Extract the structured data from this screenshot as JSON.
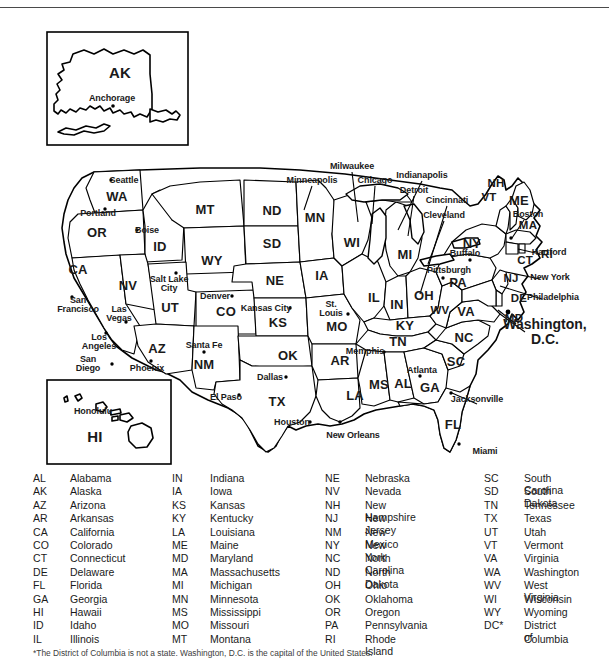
{
  "document": {
    "title": "Map of the United States with State Abbreviations",
    "footnote": "*The District of Columbia is not a state. Washington, D.C. is the capital of the United States."
  },
  "insets": [
    {
      "name": "alaska",
      "abbr": "AK",
      "cities": [
        "Anchorage"
      ]
    },
    {
      "name": "hawaii",
      "abbr": "HI",
      "cities": [
        "Honolulu"
      ]
    }
  ],
  "map": {
    "capital_label": "Washington,\nD.C.",
    "capital_line1": "Washington,",
    "capital_line2": "D.C.",
    "state_labels": [
      {
        "abbr": "WA",
        "x": 117,
        "y": 182
      },
      {
        "abbr": "OR",
        "x": 97,
        "y": 218
      },
      {
        "abbr": "CA",
        "x": 78,
        "y": 255
      },
      {
        "abbr": "NV",
        "x": 128,
        "y": 271
      },
      {
        "abbr": "ID",
        "x": 160,
        "y": 232
      },
      {
        "abbr": "MT",
        "x": 205,
        "y": 195
      },
      {
        "abbr": "WY",
        "x": 212,
        "y": 246
      },
      {
        "abbr": "UT",
        "x": 170,
        "y": 293
      },
      {
        "abbr": "AZ",
        "x": 157,
        "y": 334
      },
      {
        "abbr": "NM",
        "x": 204,
        "y": 350
      },
      {
        "abbr": "CO",
        "x": 226,
        "y": 297
      },
      {
        "abbr": "ND",
        "x": 272,
        "y": 196
      },
      {
        "abbr": "SD",
        "x": 272,
        "y": 229
      },
      {
        "abbr": "NE",
        "x": 275,
        "y": 266
      },
      {
        "abbr": "KS",
        "x": 278,
        "y": 308
      },
      {
        "abbr": "OK",
        "x": 288,
        "y": 341
      },
      {
        "abbr": "TX",
        "x": 277,
        "y": 387
      },
      {
        "abbr": "MN",
        "x": 315,
        "y": 203
      },
      {
        "abbr": "IA",
        "x": 322,
        "y": 261
      },
      {
        "abbr": "MO",
        "x": 337,
        "y": 312
      },
      {
        "abbr": "AR",
        "x": 340,
        "y": 346
      },
      {
        "abbr": "LA",
        "x": 355,
        "y": 381
      },
      {
        "abbr": "WI",
        "x": 352,
        "y": 228
      },
      {
        "abbr": "IL",
        "x": 374,
        "y": 283
      },
      {
        "abbr": "MS",
        "x": 379,
        "y": 370
      },
      {
        "abbr": "AL",
        "x": 403,
        "y": 369
      },
      {
        "abbr": "MI",
        "x": 405,
        "y": 240
      },
      {
        "abbr": "IN",
        "x": 397,
        "y": 290
      },
      {
        "abbr": "KY",
        "x": 405,
        "y": 311
      },
      {
        "abbr": "TN",
        "x": 398,
        "y": 327
      },
      {
        "abbr": "OH",
        "x": 424,
        "y": 281
      },
      {
        "abbr": "GA",
        "x": 430,
        "y": 373
      },
      {
        "abbr": "FL",
        "x": 453,
        "y": 410
      },
      {
        "abbr": "SC",
        "x": 456,
        "y": 347
      },
      {
        "abbr": "NC",
        "x": 464,
        "y": 323
      },
      {
        "abbr": "WV",
        "x": 440,
        "y": 297
      },
      {
        "abbr": "VA",
        "x": 466,
        "y": 297
      },
      {
        "abbr": "PA",
        "x": 458,
        "y": 268
      },
      {
        "abbr": "NY",
        "x": 472,
        "y": 229
      },
      {
        "abbr": "VT",
        "x": 489,
        "y": 184
      },
      {
        "abbr": "NH",
        "x": 496,
        "y": 170
      },
      {
        "abbr": "ME",
        "x": 519,
        "y": 186
      },
      {
        "abbr": "MA",
        "x": 528,
        "y": 212
      },
      {
        "abbr": "CT",
        "x": 525,
        "y": 247
      },
      {
        "abbr": "RI",
        "x": 547,
        "y": 241
      },
      {
        "abbr": "NJ",
        "x": 511,
        "y": 265
      },
      {
        "abbr": "DE",
        "x": 519,
        "y": 285
      },
      {
        "abbr": "MD",
        "x": 514,
        "y": 305
      }
    ],
    "city_labels": [
      {
        "name": "Seattle",
        "x": 124,
        "y": 166
      },
      {
        "name": "Portland",
        "x": 98,
        "y": 199
      },
      {
        "name": "Boise",
        "x": 147,
        "y": 216
      },
      {
        "name": "San\nFrancisco",
        "x": 78,
        "y": 291
      },
      {
        "name": "Las\nVegas",
        "x": 119,
        "y": 300
      },
      {
        "name": "Los\nAngeles",
        "x": 99,
        "y": 328
      },
      {
        "name": "San\nDiego",
        "x": 88,
        "y": 350
      },
      {
        "name": "Phoenix",
        "x": 147,
        "y": 354
      },
      {
        "name": "Salt Lake\nCity",
        "x": 169,
        "y": 270
      },
      {
        "name": "Denver",
        "x": 215,
        "y": 282
      },
      {
        "name": "Santa Fe",
        "x": 204,
        "y": 331
      },
      {
        "name": "El Paso",
        "x": 226,
        "y": 383
      },
      {
        "name": "Dallas",
        "x": 270,
        "y": 363
      },
      {
        "name": "Houston",
        "x": 292,
        "y": 408
      },
      {
        "name": "New Orleans",
        "x": 353,
        "y": 421
      },
      {
        "name": "Kansas City",
        "x": 266,
        "y": 294
      },
      {
        "name": "St.\nLouis",
        "x": 331,
        "y": 295
      },
      {
        "name": "Memphis",
        "x": 365,
        "y": 337
      },
      {
        "name": "Minneapolis",
        "x": 312,
        "y": 166
      },
      {
        "name": "Milwaukee",
        "x": 352,
        "y": 152
      },
      {
        "name": "Chicago",
        "x": 375,
        "y": 166
      },
      {
        "name": "Indianapolis",
        "x": 422,
        "y": 161
      },
      {
        "name": "Detroit",
        "x": 414,
        "y": 176
      },
      {
        "name": "Cincinnati",
        "x": 447,
        "y": 186
      },
      {
        "name": "Cleveland",
        "x": 444,
        "y": 201
      },
      {
        "name": "Buffalo",
        "x": 465,
        "y": 239
      },
      {
        "name": "Pittsburgh",
        "x": 449,
        "y": 256
      },
      {
        "name": "Boston",
        "x": 528,
        "y": 200
      },
      {
        "name": "Hartford",
        "x": 549,
        "y": 238
      },
      {
        "name": "New York",
        "x": 550,
        "y": 263
      },
      {
        "name": "Philadelphia",
        "x": 553,
        "y": 283
      },
      {
        "name": "Atlanta",
        "x": 422,
        "y": 356
      },
      {
        "name": "Jacksonville",
        "x": 477,
        "y": 385
      },
      {
        "name": "Miami",
        "x": 485,
        "y": 437
      }
    ]
  },
  "legend": {
    "columns": [
      {
        "abbr_x": 33,
        "name_x": 70,
        "rows": [
          {
            "abbr": "AL",
            "name": "Alabama"
          },
          {
            "abbr": "AK",
            "name": "Alaska"
          },
          {
            "abbr": "AZ",
            "name": "Arizona"
          },
          {
            "abbr": "AR",
            "name": "Arkansas"
          },
          {
            "abbr": "CA",
            "name": "California"
          },
          {
            "abbr": "CO",
            "name": "Colorado"
          },
          {
            "abbr": "CT",
            "name": "Connecticut"
          },
          {
            "abbr": "DE",
            "name": "Delaware"
          },
          {
            "abbr": "FL",
            "name": "Florida"
          },
          {
            "abbr": "GA",
            "name": "Georgia"
          },
          {
            "abbr": "HI",
            "name": "Hawaii"
          },
          {
            "abbr": "ID",
            "name": "Idaho"
          },
          {
            "abbr": "IL",
            "name": "Illinois"
          }
        ]
      },
      {
        "abbr_x": 172,
        "name_x": 210,
        "rows": [
          {
            "abbr": "IN",
            "name": "Indiana"
          },
          {
            "abbr": "IA",
            "name": "Iowa"
          },
          {
            "abbr": "KS",
            "name": "Kansas"
          },
          {
            "abbr": "KY",
            "name": "Kentucky"
          },
          {
            "abbr": "LA",
            "name": "Louisiana"
          },
          {
            "abbr": "ME",
            "name": "Maine"
          },
          {
            "abbr": "MD",
            "name": "Maryland"
          },
          {
            "abbr": "MA",
            "name": "Massachusetts"
          },
          {
            "abbr": "MI",
            "name": "Michigan"
          },
          {
            "abbr": "MN",
            "name": "Minnesota"
          },
          {
            "abbr": "MS",
            "name": "Mississippi"
          },
          {
            "abbr": "MO",
            "name": "Missouri"
          },
          {
            "abbr": "MT",
            "name": "Montana"
          }
        ]
      },
      {
        "abbr_x": 325,
        "name_x": 365,
        "rows": [
          {
            "abbr": "NE",
            "name": "Nebraska"
          },
          {
            "abbr": "NV",
            "name": "Nevada"
          },
          {
            "abbr": "NH",
            "name": "New Hampshire"
          },
          {
            "abbr": "NJ",
            "name": "New Jersey"
          },
          {
            "abbr": "NM",
            "name": "New Mexico"
          },
          {
            "abbr": "NY",
            "name": "New York"
          },
          {
            "abbr": "NC",
            "name": "North Carolina"
          },
          {
            "abbr": "ND",
            "name": "North Dakota"
          },
          {
            "abbr": "OH",
            "name": "Ohio"
          },
          {
            "abbr": "OK",
            "name": "Oklahoma"
          },
          {
            "abbr": "OR",
            "name": "Oregon"
          },
          {
            "abbr": "PA",
            "name": "Pennsylvania"
          },
          {
            "abbr": "RI",
            "name": "Rhode Island"
          }
        ]
      },
      {
        "abbr_x": 484,
        "name_x": 524,
        "rows": [
          {
            "abbr": "SC",
            "name": "South Carolina"
          },
          {
            "abbr": "SD",
            "name": "South Dakota"
          },
          {
            "abbr": "TN",
            "name": "Tennessee"
          },
          {
            "abbr": "TX",
            "name": "Texas"
          },
          {
            "abbr": "UT",
            "name": "Utah"
          },
          {
            "abbr": "VT",
            "name": "Vermont"
          },
          {
            "abbr": "VA",
            "name": "Virginia"
          },
          {
            "abbr": "WA",
            "name": "Washington"
          },
          {
            "abbr": "WV",
            "name": "West Virginia"
          },
          {
            "abbr": "WI",
            "name": "Wisconsin"
          },
          {
            "abbr": "WY",
            "name": "Wyoming"
          },
          {
            "abbr": "DC*",
            "name": "District of"
          },
          {
            "abbr": "",
            "name": "Columbia"
          }
        ]
      }
    ]
  },
  "colors": {
    "ink": "#000000",
    "paper": "#ffffff",
    "rule": "#4a4a4a"
  }
}
